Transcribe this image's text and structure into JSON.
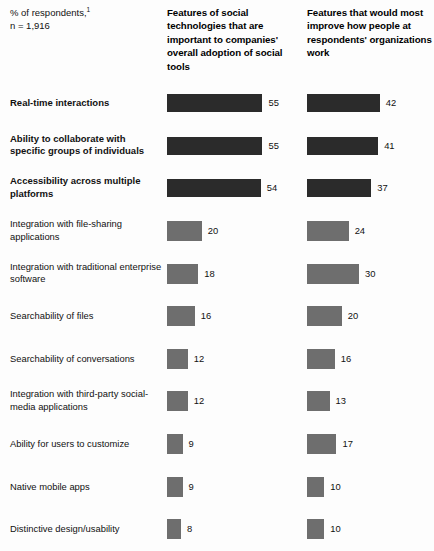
{
  "header": {
    "subject_line1": "% of respondents,",
    "subject_superscript": "1",
    "subject_line2": "n = 1,916",
    "column1_title": "Features of social technologies that are important to companies' overall adoption of social tools",
    "column2_title": "Features that would most improve how people at respondents' organizations work"
  },
  "chart_data": {
    "type": "bar",
    "title": "",
    "subtitle": "% of respondents,1  n = 1,916",
    "xlabel": "",
    "ylabel": "",
    "xlim": [
      0,
      60
    ],
    "grid": false,
    "legend_position": "top",
    "orientation": "horizontal",
    "categories": [
      "Real-time interactions",
      "Ability to collaborate with specific groups of individuals",
      "Accessibility across multiple platforms",
      "Integration with file-sharing applications",
      "Integration with traditional enterprise software",
      "Searchability of files",
      "Searchability of conversations",
      "Integration with third-party social-media applications",
      "Ability for users to customize",
      "Native mobile apps",
      "Distinctive design/usability"
    ],
    "series": [
      {
        "name": "Features of social technologies that are important to companies' overall adoption of social tools",
        "values": [
          55,
          55,
          54,
          20,
          18,
          16,
          12,
          12,
          9,
          9,
          8
        ]
      },
      {
        "name": "Features that would most improve how people at respondents' organizations work",
        "values": [
          42,
          41,
          37,
          24,
          30,
          20,
          16,
          13,
          17,
          10,
          10
        ]
      }
    ],
    "emphasized_rows": [
      0,
      1,
      2
    ],
    "colors": {
      "emphasized_bar": "#2b2b2b",
      "standard_bar": "#6e6e6e",
      "background": "#fdfdfd",
      "text": "#111111"
    }
  },
  "rows": [
    {
      "label": "Real-time interactions",
      "v1": 55,
      "v2": 42,
      "emph": true
    },
    {
      "label": "Ability to collaborate with specific groups of individuals",
      "v1": 55,
      "v2": 41,
      "emph": true
    },
    {
      "label": "Accessibility across multiple platforms",
      "v1": 54,
      "v2": 37,
      "emph": true
    },
    {
      "label": "Integration with file-sharing applications",
      "v1": 20,
      "v2": 24,
      "emph": false
    },
    {
      "label": "Integration with traditional enterprise software",
      "v1": 18,
      "v2": 30,
      "emph": false
    },
    {
      "label": "Searchability of files",
      "v1": 16,
      "v2": 20,
      "emph": false
    },
    {
      "label": "Searchability of conversations",
      "v1": 12,
      "v2": 16,
      "emph": false
    },
    {
      "label": "Integration with third-party social-media applications",
      "v1": 12,
      "v2": 13,
      "emph": false
    },
    {
      "label": "Ability for users to customize",
      "v1": 9,
      "v2": 17,
      "emph": false
    },
    {
      "label": "Native mobile apps",
      "v1": 9,
      "v2": 10,
      "emph": false
    },
    {
      "label": "Distinctive design/usability",
      "v1": 8,
      "v2": 10,
      "emph": false
    }
  ],
  "scale_px_per_unit": 1.735
}
